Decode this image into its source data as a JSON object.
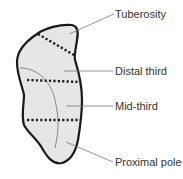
{
  "diagram": {
    "colors": {
      "outline": "#1a1a1a",
      "fill": "#e6e6e6",
      "leader": "#777777",
      "text": "#333333"
    },
    "labels": [
      {
        "id": "tuberosity",
        "text": "Tuberosity"
      },
      {
        "id": "distal-third",
        "text": "Distal third"
      },
      {
        "id": "mid-third",
        "text": "Mid-third"
      },
      {
        "id": "proximal-pole",
        "text": "Proximal pole"
      }
    ]
  }
}
